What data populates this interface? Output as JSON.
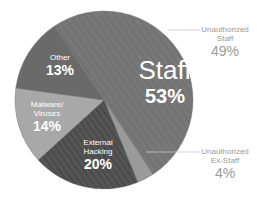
{
  "chart_data": {
    "type": "pie",
    "title": "",
    "slices": [
      {
        "label": "Staff",
        "value": 53,
        "display": "53%",
        "color": "#787878"
      },
      {
        "label": "External Hacking",
        "value": 20,
        "display": "20%",
        "color": "#555555",
        "pattern": "diagonal-stripes"
      },
      {
        "label": "Malware/ Viruses",
        "value": 14,
        "display": "14%",
        "color": "#a8a8a8"
      },
      {
        "label": "Other",
        "value": 13,
        "display": "13%",
        "color": "#6a6a6a"
      }
    ],
    "sub_breakdown": {
      "parent": "Staff",
      "items": [
        {
          "label": "Unauthorized Staff",
          "value": 49,
          "display": "49%"
        },
        {
          "label": "Unauthorized Ex-Staff",
          "value": 4,
          "display": "4%",
          "color": "#9a9a9a"
        }
      ]
    },
    "rendered_wedges_deg_clockwise_from_top": [
      {
        "label": "Staff",
        "start": 326,
        "end": 506.5
      },
      {
        "label": "Unauthorized Ex-Staff",
        "start": 146.5,
        "end": 157.7
      },
      {
        "label": "External Hacking",
        "start": 157.7,
        "end": 227.7
      },
      {
        "label": "Malware/ Viruses",
        "start": 227.7,
        "end": 277.8
      },
      {
        "label": "Other",
        "start": 277.8,
        "end": 326
      }
    ],
    "legend": "none (direct labels)"
  },
  "labels": {
    "staff": {
      "name": "Staff",
      "pct": "53%"
    },
    "other": {
      "name": "Other",
      "pct": "13%"
    },
    "malware": {
      "line1": "Malware/",
      "line2": "Viruses",
      "pct": "14%"
    },
    "external": {
      "line1": "External",
      "line2": "Hacking",
      "pct": "20%"
    },
    "unauth_staff": {
      "line1": "Unauthorized",
      "line2": "Staff",
      "pct": "49%"
    },
    "unauth_exstaff": {
      "line1": "Unauthorized",
      "line2": "Ex-Staff",
      "pct": "4%"
    }
  }
}
